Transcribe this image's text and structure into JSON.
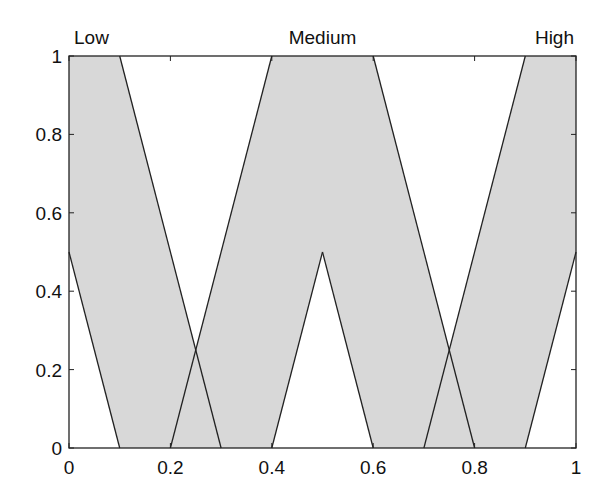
{
  "chart_data": {
    "type": "area",
    "title": "",
    "xlabel": "",
    "ylabel": "",
    "xlim": [
      0,
      1
    ],
    "ylim": [
      0,
      1
    ],
    "grid": false,
    "xticks": [
      "0",
      "0.2",
      "0.4",
      "0.6",
      "0.8",
      "1"
    ],
    "yticks": [
      "0",
      "0.2",
      "0.4",
      "0.6",
      "0.8",
      "1"
    ],
    "annotations": [
      {
        "text": "Low",
        "x": 0.0
      },
      {
        "text": "Medium",
        "x": 0.5
      },
      {
        "text": "High",
        "x": 1.0
      }
    ],
    "fill_color": "#d8d8d8",
    "line_color": "#222222",
    "series": [
      {
        "name": "Low",
        "polygon": [
          [
            0,
            0.5
          ],
          [
            0,
            1
          ],
          [
            0.1,
            1
          ],
          [
            0.3,
            0
          ],
          [
            0.1,
            0
          ]
        ]
      },
      {
        "name": "Medium",
        "polygon": [
          [
            0.2,
            0
          ],
          [
            0.4,
            1
          ],
          [
            0.6,
            1
          ],
          [
            0.8,
            0
          ],
          [
            0.6,
            0
          ],
          [
            0.5,
            0.5
          ],
          [
            0.4,
            0
          ]
        ]
      },
      {
        "name": "High",
        "polygon": [
          [
            0.7,
            0
          ],
          [
            0.9,
            1
          ],
          [
            1,
            1
          ],
          [
            1,
            0.5
          ],
          [
            0.9,
            0
          ]
        ]
      }
    ],
    "boundary_lines": [
      {
        "from": [
          0,
          0.5
        ],
        "to": [
          0.1,
          0
        ]
      },
      {
        "from": [
          0.1,
          1
        ],
        "to": [
          0.3,
          0
        ]
      },
      {
        "from": [
          0.2,
          0
        ],
        "to": [
          0.4,
          1
        ]
      },
      {
        "from": [
          0.4,
          0
        ],
        "to": [
          0.5,
          0.5
        ]
      },
      {
        "from": [
          0.5,
          0.5
        ],
        "to": [
          0.6,
          0
        ]
      },
      {
        "from": [
          0.6,
          1
        ],
        "to": [
          0.8,
          0
        ]
      },
      {
        "from": [
          0.7,
          0
        ],
        "to": [
          0.9,
          1
        ]
      },
      {
        "from": [
          0.9,
          0
        ],
        "to": [
          1,
          0.5
        ]
      }
    ]
  }
}
